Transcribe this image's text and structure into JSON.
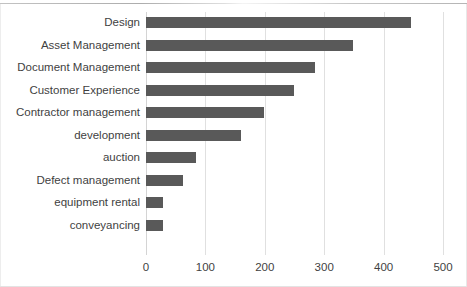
{
  "chart_data": {
    "type": "bar",
    "orientation": "horizontal",
    "title": "",
    "xlabel": "",
    "ylabel": "",
    "categories": [
      "Design",
      "Asset Management",
      "Document Management",
      "Customer Experience",
      "Contractor management",
      "development",
      "auction",
      "Defect management",
      "equipment rental",
      "conveyancing"
    ],
    "values": [
      446,
      348,
      285,
      249,
      199,
      160,
      84,
      62,
      29,
      29
    ],
    "xlim": [
      0,
      500
    ],
    "xticks": [
      0,
      100,
      200,
      300,
      400,
      500
    ],
    "xtick_labels": [
      "0",
      "100",
      "200",
      "300",
      "400",
      "500"
    ],
    "grid": true,
    "grid_axis": "x",
    "legend": false,
    "bar_color": "#595959",
    "gridline_color": "#e0e0e0",
    "text_color": "#3f3f3f"
  }
}
